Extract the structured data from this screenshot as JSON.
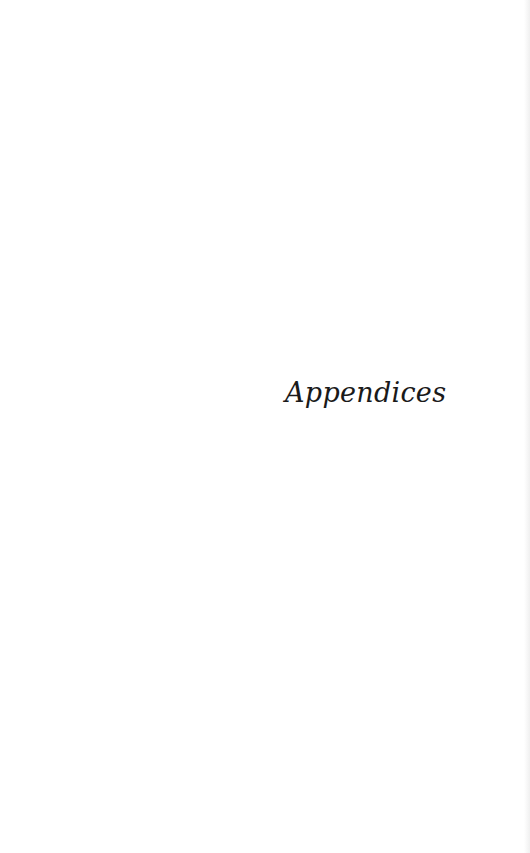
{
  "page": {
    "heading": "Appendices"
  }
}
